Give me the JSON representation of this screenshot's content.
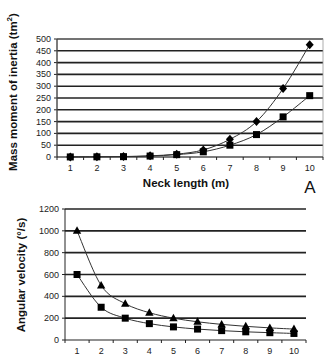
{
  "chart_data": [
    {
      "type": "line",
      "panel_label": "A",
      "title": "",
      "xlabel": "Neck length (m)",
      "ylabel": "Mass moment of inertia (tm²)",
      "ylabel_main": "Mass moment of inertia (tm",
      "ylabel_sup": "2",
      "ylabel_end": ")",
      "x": [
        1,
        2,
        3,
        4,
        5,
        6,
        7,
        8,
        9,
        10
      ],
      "xticks": [
        "1",
        "2",
        "3",
        "4",
        "5",
        "6",
        "7",
        "8",
        "9",
        "10"
      ],
      "ylim": [
        0,
        500
      ],
      "yticks": [
        "0",
        "50",
        "100",
        "150",
        "200",
        "250",
        "300",
        "350",
        "400",
        "450",
        "500"
      ],
      "grid": true,
      "series": [
        {
          "name": "diamond-series",
          "marker": "diamond",
          "values": [
            0.5,
            1,
            2,
            5,
            12,
            30,
            75,
            150,
            290,
            476
          ]
        },
        {
          "name": "square-series",
          "marker": "square",
          "values": [
            0.3,
            0.8,
            1.5,
            4,
            10,
            22,
            50,
            95,
            170,
            260
          ]
        }
      ]
    },
    {
      "type": "line",
      "title": "",
      "xlabel": "",
      "ylabel": "Angular velocity (°/s)",
      "x": [
        1,
        2,
        3,
        4,
        5,
        6,
        7,
        8,
        9,
        10
      ],
      "xticks": [
        "1",
        "2",
        "3",
        "4",
        "5",
        "6",
        "7",
        "8",
        "9",
        "10"
      ],
      "ylim": [
        0,
        1200
      ],
      "yticks": [
        "0",
        "200",
        "400",
        "600",
        "800",
        "1000",
        "1200"
      ],
      "grid": true,
      "series": [
        {
          "name": "triangle-series",
          "marker": "triangle",
          "values": [
            1000,
            500,
            333,
            250,
            200,
            167,
            143,
            125,
            111,
            100
          ]
        },
        {
          "name": "square-series",
          "marker": "square",
          "values": [
            600,
            300,
            200,
            150,
            120,
            100,
            86,
            75,
            67,
            60
          ]
        }
      ]
    }
  ]
}
